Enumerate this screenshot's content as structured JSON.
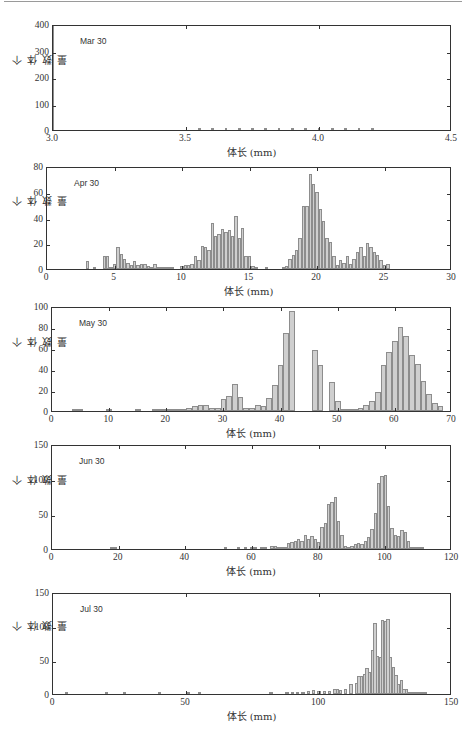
{
  "chart_data": [
    {
      "type": "bar",
      "title": "",
      "annotation": "Mar 30",
      "xlabel": "体长 (mm)",
      "ylabel": "个体数量",
      "xlim": [
        3.0,
        4.5
      ],
      "ylim": [
        0,
        400
      ],
      "xticks": [
        "3.0",
        "3.5",
        "4.0",
        "4.5"
      ],
      "xtick_values": [
        3.0,
        3.5,
        4.0,
        4.5
      ],
      "yticks": [
        "0",
        "100",
        "200",
        "300",
        "400"
      ],
      "ytick_values": [
        0,
        100,
        200,
        300,
        400
      ],
      "grid": false,
      "bin_width": 0.01,
      "x": [
        3.0,
        3.55,
        3.6,
        3.65,
        3.7,
        3.75,
        3.8,
        3.85,
        3.9,
        3.95,
        4.0,
        4.05,
        4.1,
        4.15,
        4.2
      ],
      "values": [
        400,
        1,
        2,
        2,
        3,
        4,
        3,
        3,
        2,
        2,
        2,
        1,
        1,
        1,
        1
      ]
    },
    {
      "type": "bar",
      "title": "",
      "annotation": "Apr 30",
      "xlabel": "体长 (mm)",
      "ylabel": "个体数量",
      "xlim": [
        0,
        30
      ],
      "ylim": [
        0,
        80
      ],
      "xticks": [
        "0",
        "5",
        "10",
        "15",
        "20",
        "25",
        "30"
      ],
      "xtick_values": [
        0,
        5,
        10,
        15,
        20,
        25,
        30
      ],
      "yticks": [
        "0",
        "20",
        "40",
        "60",
        "80"
      ],
      "ytick_values": [
        0,
        20,
        40,
        60,
        80
      ],
      "grid": false,
      "bin_width": 0.25,
      "x": [
        3.0,
        3.5,
        4.25,
        4.5,
        4.75,
        5.0,
        5.25,
        5.5,
        5.75,
        6.0,
        6.25,
        6.5,
        6.75,
        7.0,
        7.25,
        7.5,
        7.75,
        8.0,
        8.25,
        8.5,
        8.75,
        9.0,
        9.25,
        10.0,
        10.25,
        10.5,
        10.75,
        11.0,
        11.25,
        11.5,
        11.75,
        12.0,
        12.25,
        12.5,
        12.75,
        13.0,
        13.25,
        13.5,
        13.75,
        14.0,
        14.25,
        14.5,
        14.75,
        15.0,
        15.25,
        15.5,
        16.25,
        17.5,
        17.75,
        18.0,
        18.25,
        18.5,
        18.75,
        19.0,
        19.25,
        19.5,
        19.75,
        20.0,
        20.25,
        20.5,
        20.75,
        21.0,
        21.25,
        21.5,
        21.75,
        22.0,
        22.25,
        22.5,
        22.75,
        23.0,
        23.25,
        23.5,
        23.75,
        24.0,
        24.25,
        24.5,
        24.75,
        25.0,
        25.25
      ],
      "values": [
        6,
        1,
        10,
        10,
        1,
        4,
        17,
        12,
        8,
        5,
        3,
        6,
        3,
        4,
        4,
        2,
        1,
        4,
        1,
        1,
        1,
        1,
        1,
        2,
        3,
        3,
        4,
        10,
        7,
        18,
        17,
        15,
        36,
        26,
        27,
        31,
        29,
        30,
        26,
        41,
        24,
        32,
        10,
        10,
        2,
        1,
        1,
        1,
        2,
        8,
        11,
        15,
        24,
        49,
        49,
        74,
        66,
        60,
        47,
        37,
        24,
        21,
        10,
        3,
        7,
        5,
        10,
        4,
        8,
        13,
        17,
        10,
        20,
        17,
        13,
        11,
        7,
        3,
        4
      ],
      "last_bar_value_note": "small bars ~2-4 near 24.75-25.25"
    },
    {
      "type": "bar",
      "title": "",
      "annotation": "May 30",
      "xlabel": "体长 (mm)",
      "ylabel": "个体数量",
      "xlim": [
        0,
        70
      ],
      "ylim": [
        0,
        100
      ],
      "xticks": [
        "0",
        "10",
        "20",
        "30",
        "40",
        "50",
        "60",
        "70"
      ],
      "xtick_values": [
        0,
        10,
        20,
        30,
        40,
        50,
        60,
        70
      ],
      "yticks": [
        "0",
        "20",
        "40",
        "60",
        "80",
        "100"
      ],
      "ytick_values": [
        0,
        20,
        40,
        60,
        80,
        100
      ],
      "grid": false,
      "bin_width": 1,
      "x": [
        4,
        5,
        10,
        15,
        18,
        19,
        20,
        21,
        22,
        23,
        24,
        25,
        26,
        27,
        28,
        29,
        30,
        31,
        32,
        33,
        34,
        35,
        36,
        37,
        38,
        39,
        40,
        41,
        42,
        46,
        47,
        49,
        50,
        51,
        52,
        53,
        54,
        55,
        56,
        57,
        58,
        59,
        60,
        61,
        62,
        63,
        64,
        65,
        66,
        67,
        68
      ],
      "values": [
        1,
        1,
        2,
        1,
        1,
        1,
        2,
        2,
        1,
        1,
        3,
        5,
        6,
        6,
        3,
        3,
        11,
        14,
        26,
        13,
        3,
        3,
        6,
        5,
        12,
        25,
        44,
        74,
        95,
        58,
        44,
        28,
        10,
        2,
        1,
        1,
        3,
        6,
        10,
        18,
        44,
        56,
        67,
        80,
        71,
        53,
        45,
        29,
        16,
        8,
        5
      ],
      "note": "Main peaks: ~38 mm (95) and ~54 mm (80); secondary at 31 mm (26) and 60-64 mm (~20)"
    },
    {
      "type": "bar",
      "title": "",
      "annotation": "Jun 30",
      "xlabel": "体长 (mm)",
      "ylabel": "个体数量",
      "xlim": [
        0,
        120
      ],
      "ylim": [
        0,
        150
      ],
      "xticks": [
        "0",
        "20",
        "40",
        "60",
        "80",
        "100",
        "120"
      ],
      "xtick_values": [
        0,
        20,
        40,
        60,
        80,
        100,
        120
      ],
      "yticks": [
        "0",
        "50",
        "100",
        "150"
      ],
      "ytick_values": [
        0,
        50,
        100,
        150
      ],
      "grid": false,
      "bin_width": 1,
      "x": [
        18,
        19,
        52,
        56,
        58,
        60,
        61,
        63,
        64,
        66,
        67,
        68,
        69,
        70,
        71,
        72,
        73,
        74,
        75,
        76,
        77,
        78,
        79,
        80,
        81,
        82,
        83,
        84,
        85,
        86,
        87,
        88,
        89,
        90,
        91,
        92,
        93,
        94,
        95,
        96,
        97,
        98,
        99,
        100,
        101,
        102,
        103,
        104,
        105,
        106,
        107,
        108,
        109,
        110,
        111
      ],
      "values": [
        1,
        1,
        1,
        2,
        2,
        3,
        2,
        3,
        3,
        4,
        4,
        3,
        2,
        2,
        9,
        10,
        12,
        14,
        12,
        20,
        15,
        18,
        14,
        10,
        31,
        37,
        65,
        67,
        75,
        40,
        20,
        4,
        3,
        4,
        7,
        8,
        7,
        12,
        17,
        28,
        52,
        94,
        104,
        106,
        61,
        30,
        20,
        19,
        27,
        25,
        11,
        1,
        1,
        1,
        1
      ],
      "note": "Peaks at ~87 mm (75) and ~103 mm (106)"
    },
    {
      "type": "bar",
      "title": "",
      "annotation": "Jul 30",
      "xlabel": "体长 (mm)",
      "ylabel": "个体数量",
      "xlim": [
        0,
        150
      ],
      "ylim": [
        0,
        150
      ],
      "xticks": [
        "0",
        "50",
        "100",
        "150"
      ],
      "xtick_values": [
        0,
        50,
        100,
        150
      ],
      "yticks": [
        "0",
        "50",
        "100",
        "150"
      ],
      "ytick_values": [
        0,
        50,
        100,
        150
      ],
      "grid": false,
      "bin_width": 1.25,
      "x": [
        5,
        20,
        27,
        40,
        51,
        55,
        82,
        88,
        90,
        92,
        94,
        96,
        98,
        100,
        102,
        104,
        106,
        107,
        108,
        110,
        112,
        114,
        115,
        116,
        117,
        118,
        119,
        120,
        121,
        122,
        123,
        124,
        125,
        126,
        127,
        128,
        129,
        130,
        131,
        132,
        133,
        134,
        135,
        136,
        137,
        138,
        139,
        140
      ],
      "values": [
        1,
        1,
        1,
        2,
        1,
        1,
        1,
        2,
        1,
        2,
        3,
        5,
        6,
        4,
        5,
        4,
        8,
        7,
        6,
        8,
        14,
        16,
        27,
        27,
        30,
        38,
        33,
        64,
        104,
        56,
        54,
        109,
        108,
        110,
        54,
        40,
        28,
        15,
        20,
        8,
        7,
        1,
        1,
        1,
        1,
        1,
        1,
        1
      ],
      "note": "Peaks at ~121 mm (104) and ~125-127 mm (~110)"
    }
  ],
  "panels": [
    {
      "annotation": "Mar 30",
      "xlabel": "体长 (mm)",
      "ylabel": "个体数量"
    },
    {
      "annotation": "Apr 30",
      "xlabel": "体长 (mm)",
      "ylabel": "个体数量"
    },
    {
      "annotation": "May 30",
      "xlabel": "体长 (mm)",
      "ylabel": "个体数量"
    },
    {
      "annotation": "Jun 30",
      "xlabel": "体长 (mm)",
      "ylabel": "个体数量"
    },
    {
      "annotation": "Jul 30",
      "xlabel": "体长 (mm)",
      "ylabel": "个体数量"
    }
  ],
  "colors": {
    "bar_fill": "#cfcfcf",
    "bar_edge": "#8d8d8d",
    "axis": "#333333"
  }
}
